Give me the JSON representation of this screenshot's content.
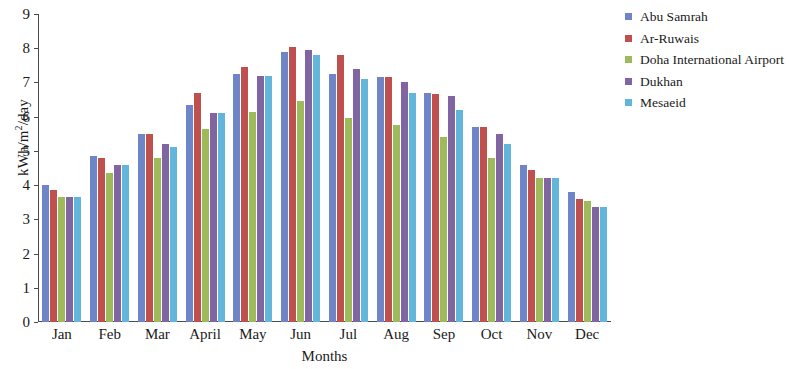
{
  "chart_data": {
    "type": "bar",
    "title": "",
    "xlabel": "Months",
    "ylabel": "kWh/m2/day",
    "ylabel_html": "kWh/m²/day",
    "ylim": [
      0,
      9
    ],
    "yticks": [
      0,
      1,
      2,
      3,
      4,
      5,
      6,
      7,
      8,
      9
    ],
    "grid": false,
    "legend_position": "right",
    "categories": [
      "Jan",
      "Feb",
      "Mar",
      "April",
      "May",
      "Jun",
      "Jul",
      "Aug",
      "Sep",
      "Oct",
      "Nov",
      "Dec"
    ],
    "series": [
      {
        "name": "Abu Samrah",
        "color": "#6E86C8",
        "values": [
          4.0,
          4.85,
          5.5,
          6.35,
          7.25,
          7.9,
          7.25,
          7.15,
          6.7,
          5.7,
          4.6,
          3.8
        ]
      },
      {
        "name": "Ar-Ruwais",
        "color": "#C0504D",
        "values": [
          3.85,
          4.8,
          5.5,
          6.7,
          7.45,
          8.05,
          7.8,
          7.15,
          6.65,
          5.7,
          4.45,
          3.6
        ]
      },
      {
        "name": "Doha International Airport",
        "color": "#9DBB5B",
        "values": [
          3.65,
          4.35,
          4.8,
          5.65,
          6.15,
          6.45,
          5.95,
          5.75,
          5.4,
          4.8,
          4.2,
          3.55
        ]
      },
      {
        "name": "Dukhan",
        "color": "#8165A3",
        "values": [
          3.65,
          4.6,
          5.2,
          6.1,
          7.2,
          7.95,
          7.4,
          7.0,
          6.6,
          5.5,
          4.2,
          3.35
        ]
      },
      {
        "name": "Mesaeid",
        "color": "#62B6DC",
        "values": [
          3.65,
          4.6,
          5.1,
          6.1,
          7.2,
          7.8,
          7.1,
          6.7,
          6.2,
          5.2,
          4.2,
          3.35
        ]
      }
    ]
  }
}
